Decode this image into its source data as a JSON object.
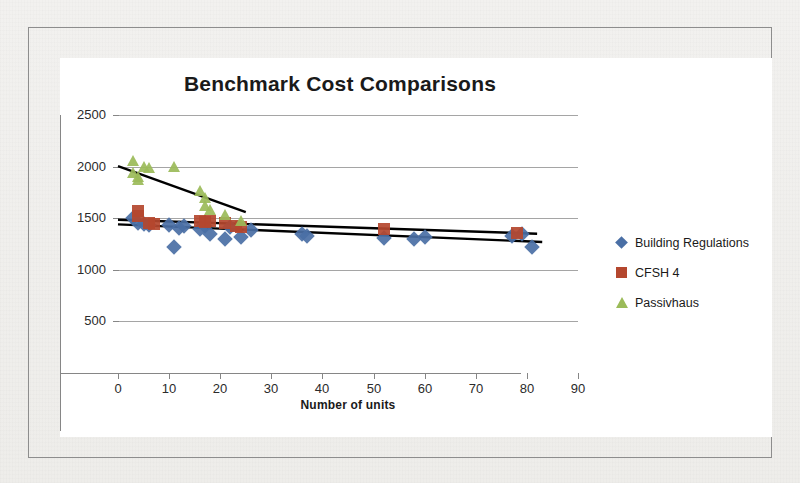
{
  "chart_data": {
    "type": "scatter",
    "title": "Benchmark Cost Comparisons",
    "xlabel": "Number of units",
    "ylabel": "",
    "xlim": [
      0,
      90
    ],
    "ylim": [
      0,
      2500
    ],
    "xticks": [
      0,
      10,
      20,
      30,
      40,
      50,
      60,
      70,
      80,
      90
    ],
    "yticks": [
      0,
      500,
      1000,
      1500,
      2000,
      2500
    ],
    "grid": "horizontal",
    "legend_position": "right",
    "series": [
      {
        "name": "Building Regulations",
        "marker": "diamond",
        "color": "#4a6fa5",
        "points": [
          [
            3,
            1500
          ],
          [
            4,
            1455
          ],
          [
            5,
            1440
          ],
          [
            6,
            1430
          ],
          [
            10,
            1430
          ],
          [
            11,
            1225
          ],
          [
            12,
            1405
          ],
          [
            13,
            1425
          ],
          [
            16,
            1400
          ],
          [
            17,
            1420
          ],
          [
            18,
            1345
          ],
          [
            21,
            1300
          ],
          [
            22,
            1410
          ],
          [
            24,
            1320
          ],
          [
            26,
            1390
          ],
          [
            36,
            1345
          ],
          [
            37,
            1325
          ],
          [
            52,
            1310
          ],
          [
            58,
            1300
          ],
          [
            60,
            1320
          ],
          [
            77,
            1330
          ],
          [
            79,
            1350
          ],
          [
            81,
            1225
          ]
        ],
        "trendline": {
          "x0": 0,
          "y0": 1440,
          "x1": 83,
          "y1": 1270
        }
      },
      {
        "name": "CFSH 4",
        "marker": "square",
        "color": "#b4472e",
        "points": [
          [
            4,
            1565
          ],
          [
            4,
            1525
          ],
          [
            6,
            1450
          ],
          [
            7,
            1445
          ],
          [
            16,
            1470
          ],
          [
            17,
            1460
          ],
          [
            18,
            1475
          ],
          [
            21,
            1455
          ],
          [
            23,
            1420
          ],
          [
            24,
            1410
          ],
          [
            52,
            1400
          ],
          [
            78,
            1360
          ]
        ],
        "trendline": {
          "x0": 0,
          "y0": 1485,
          "x1": 82,
          "y1": 1350
        }
      },
      {
        "name": "Passivhaus",
        "marker": "triangle",
        "color": "#9bbb59",
        "points": [
          [
            3,
            2050
          ],
          [
            3,
            1935
          ],
          [
            4,
            1900
          ],
          [
            4,
            1870
          ],
          [
            5,
            2000
          ],
          [
            6,
            1990
          ],
          [
            11,
            2000
          ],
          [
            16,
            1760
          ],
          [
            17,
            1700
          ],
          [
            17,
            1620
          ],
          [
            18,
            1580
          ],
          [
            21,
            1530
          ],
          [
            24,
            1470
          ]
        ],
        "trendline": {
          "x0": 0,
          "y0": 2005,
          "x1": 25,
          "y1": 1560
        }
      }
    ]
  },
  "chart": {
    "title": "Benchmark Cost Comparisons",
    "xaxis_title": "Number of units"
  },
  "legend": {
    "items": [
      {
        "label": "Building Regulations",
        "marker": "diamond-marker-icon"
      },
      {
        "label": "CFSH 4",
        "marker": "square-marker-icon"
      },
      {
        "label": "Passivhaus",
        "marker": "triangle-marker-icon"
      }
    ]
  }
}
